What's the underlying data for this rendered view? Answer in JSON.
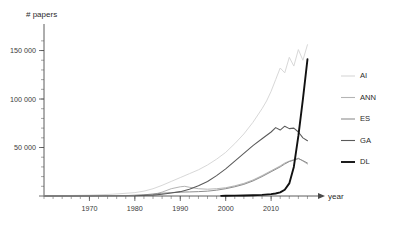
{
  "chart_data": {
    "type": "line",
    "title": "# papers",
    "xlabel": "year",
    "ylabel": "# papers",
    "xlim": [
      1960,
      2019
    ],
    "ylim": [
      0,
      165000
    ],
    "grid": false,
    "legend_position": "right",
    "y_ticks": [
      0,
      50000,
      100000,
      150000
    ],
    "y_tick_labels": [
      "",
      "50 000",
      "100 000",
      "150 000"
    ],
    "y_minor_step": 10000,
    "x_ticks": [
      1970,
      1980,
      1990,
      2000,
      2010
    ],
    "x_tick_labels": [
      "1970",
      "1980",
      "1990",
      "2000",
      "2010"
    ],
    "x_minor_step": 2,
    "series": [
      {
        "name": "AI",
        "color": "#d8d8d8",
        "width": 1.0,
        "x": [
          1960,
          1965,
          1970,
          1975,
          1980,
          1982,
          1984,
          1986,
          1988,
          1990,
          1992,
          1994,
          1996,
          1998,
          2000,
          2002,
          2004,
          2006,
          2008,
          2009,
          2010,
          2011,
          2012,
          2013,
          2014,
          2015,
          2016,
          2017,
          2018
        ],
        "values": [
          200,
          400,
          900,
          1800,
          3500,
          5000,
          7500,
          11000,
          15000,
          19000,
          23000,
          27000,
          32000,
          38000,
          45000,
          54000,
          64000,
          76000,
          90000,
          98000,
          108000,
          120000,
          132000,
          127000,
          143000,
          134000,
          151000,
          140000,
          156000
        ]
      },
      {
        "name": "ANN",
        "color": "#b4b4b4",
        "width": 1.0,
        "x": [
          1960,
          1970,
          1980,
          1984,
          1986,
          1988,
          1990,
          1991,
          1992,
          1994,
          1996,
          1998,
          2000,
          2002,
          2004,
          2006,
          2008,
          2010,
          2012,
          2013,
          2014,
          2015,
          2016,
          2017,
          2018
        ],
        "values": [
          50,
          150,
          500,
          1500,
          4000,
          7500,
          9500,
          10000,
          9000,
          7500,
          7000,
          7500,
          8500,
          10500,
          13000,
          16500,
          21000,
          26000,
          31000,
          34000,
          36000,
          37500,
          39000,
          36000,
          33000
        ]
      },
      {
        "name": "ES",
        "color": "#8e8e8e",
        "width": 1.0,
        "x": [
          1960,
          1970,
          1978,
          1982,
          1985,
          1988,
          1990,
          1992,
          1994,
          1996,
          1998,
          2000,
          2002,
          2004,
          2006,
          2008,
          2010,
          2012,
          2013,
          2014,
          2015,
          2016,
          2017,
          2018
        ],
        "values": [
          40,
          120,
          400,
          1200,
          2500,
          3500,
          4000,
          4200,
          4500,
          5000,
          6000,
          7500,
          9500,
          12000,
          15500,
          20000,
          25000,
          30000,
          33000,
          35500,
          37000,
          38500,
          36500,
          34000
        ]
      },
      {
        "name": "GA",
        "color": "#5a5a5a",
        "width": 1.05,
        "x": [
          1960,
          1970,
          1980,
          1984,
          1986,
          1988,
          1990,
          1992,
          1994,
          1996,
          1998,
          2000,
          2002,
          2004,
          2006,
          2008,
          2010,
          2011,
          2012,
          2013,
          2014,
          2015,
          2016,
          2017,
          2018
        ],
        "values": [
          20,
          60,
          300,
          900,
          1800,
          3000,
          4500,
          7000,
          10500,
          15000,
          21000,
          28000,
          36000,
          44000,
          52000,
          59000,
          66000,
          70500,
          68000,
          72000,
          69500,
          70000,
          66000,
          60000,
          57000
        ]
      },
      {
        "name": "DL",
        "color": "#111111",
        "width": 1.9,
        "x": [
          1999,
          2000,
          2002,
          2004,
          2006,
          2008,
          2010,
          2011,
          2012,
          2013,
          2014,
          2015,
          2016,
          2017,
          2018
        ],
        "values": [
          150,
          200,
          350,
          550,
          800,
          1200,
          1900,
          2600,
          3800,
          6500,
          13000,
          30000,
          62000,
          100000,
          141000
        ]
      }
    ]
  },
  "legend": {
    "entries": [
      {
        "label": "AI"
      },
      {
        "label": "ANN"
      },
      {
        "label": "ES"
      },
      {
        "label": "GA"
      },
      {
        "label": "DL"
      }
    ]
  }
}
